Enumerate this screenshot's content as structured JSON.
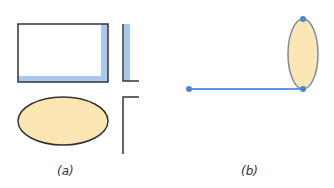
{
  "panels": [
    {
      "id": "a",
      "label": "(a)",
      "description": "rectangle with blue inner shadow on right and bottom, L-shaped corner, beige ellipse, inverted-L corner"
    },
    {
      "id": "b",
      "label": "(b)",
      "description": "horizontal blue line with endpoint dots joined to a vertical beige ellipse with dots at top and bottom"
    }
  ],
  "colors": {
    "stroke": "#333333",
    "shadow_blue": "#a9c8f0",
    "fill_beige": "#fbe6b4",
    "line_blue": "#5b9ae0",
    "dot_blue": "#4a86d0",
    "ellipse_outline_b": "#7a8ea0"
  }
}
